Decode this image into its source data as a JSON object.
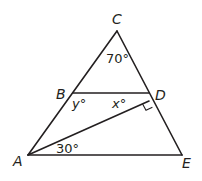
{
  "figure": {
    "points": {
      "A": {
        "label": "A",
        "x": 28,
        "y": 155
      },
      "B": {
        "label": "B",
        "x": 73,
        "y": 93
      },
      "C": {
        "label": "C",
        "x": 117,
        "y": 31
      },
      "D": {
        "label": "D",
        "x": 149,
        "y": 93
      },
      "E": {
        "label": "E",
        "x": 182,
        "y": 155
      }
    },
    "segments": [
      "AC",
      "CE",
      "AE",
      "BD",
      "AD"
    ],
    "angles": {
      "C": "70°",
      "ABD": "y°",
      "BDA": "x°",
      "DAE": "30°"
    },
    "right_angle_at": "D",
    "stroke_color": "#231f20"
  }
}
